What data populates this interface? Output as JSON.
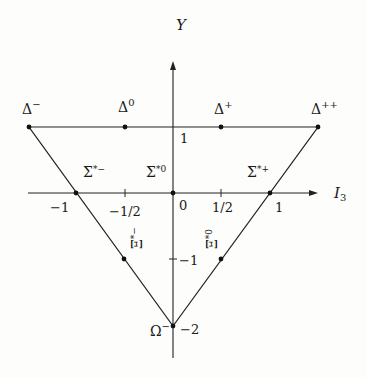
{
  "axes": {
    "y_label": "Y",
    "x_label": "I",
    "x_label_sub": "3",
    "x_ticks": [
      {
        "label": "−1",
        "value": -1
      },
      {
        "label": "−1/2",
        "value": -0.5
      },
      {
        "label": "0",
        "value": 0
      },
      {
        "label": "1/2",
        "value": 0.5
      },
      {
        "label": "1",
        "value": 1
      }
    ],
    "y_ticks": [
      {
        "label": "1",
        "value": 1
      },
      {
        "label": "−1",
        "value": -1
      },
      {
        "label": "−2",
        "value": -2
      }
    ]
  },
  "particles": {
    "delta_minus": {
      "base": "Δ",
      "sup": "−",
      "I3": -1.5,
      "Y": 1
    },
    "delta_zero": {
      "base": "Δ",
      "sup": "0",
      "I3": -0.5,
      "Y": 1
    },
    "delta_plus": {
      "base": "Δ",
      "sup": "+",
      "I3": 0.5,
      "Y": 1
    },
    "delta_plusplus": {
      "base": "Δ",
      "sup": "++",
      "I3": 1.5,
      "Y": 1
    },
    "sigma_minus": {
      "base": "Σ",
      "sup": "*−",
      "I3": -1,
      "Y": 0
    },
    "sigma_zero": {
      "base": "Σ",
      "sup": "*0",
      "I3": 0,
      "Y": 0
    },
    "sigma_plus": {
      "base": "Σ",
      "sup": "*+",
      "I3": 1,
      "Y": 0
    },
    "xi_minus": {
      "base": "Ξ",
      "sup": "*−",
      "I3": -0.5,
      "Y": -1
    },
    "xi_zero": {
      "base": "Ξ",
      "sup": "*0",
      "I3": 0.5,
      "Y": -1
    },
    "omega_minus": {
      "base": "Ω",
      "sup": "−",
      "I3": 0,
      "Y": -2
    }
  }
}
